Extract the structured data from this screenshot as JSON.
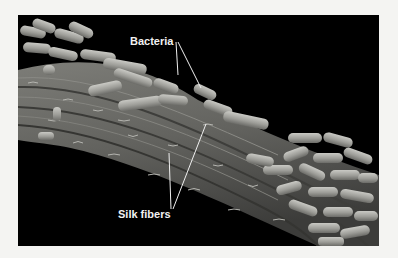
{
  "figure": {
    "background_color": "#000000",
    "page_color": "#f4f4f2",
    "fiber_color": "#6f6f6b",
    "bacteria_color": "#a9a9a4",
    "labels": {
      "bacteria": "Bacteria",
      "silk_fibers": "Silk fibers"
    }
  }
}
